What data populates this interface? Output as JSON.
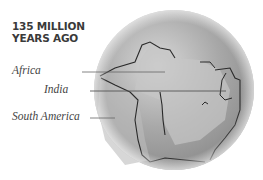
{
  "title": {
    "line1": "135 MILLION",
    "line2": "YEARS AGO"
  },
  "labels": [
    {
      "id": "africa",
      "text": "Africa"
    },
    {
      "id": "india",
      "text": "India"
    },
    {
      "id": "south_america",
      "text": "South America"
    }
  ],
  "colors": {
    "ocean": "#9a9a9a",
    "land": "#c4c4c4",
    "coast": "#2a2a2a",
    "text": "#444444"
  }
}
